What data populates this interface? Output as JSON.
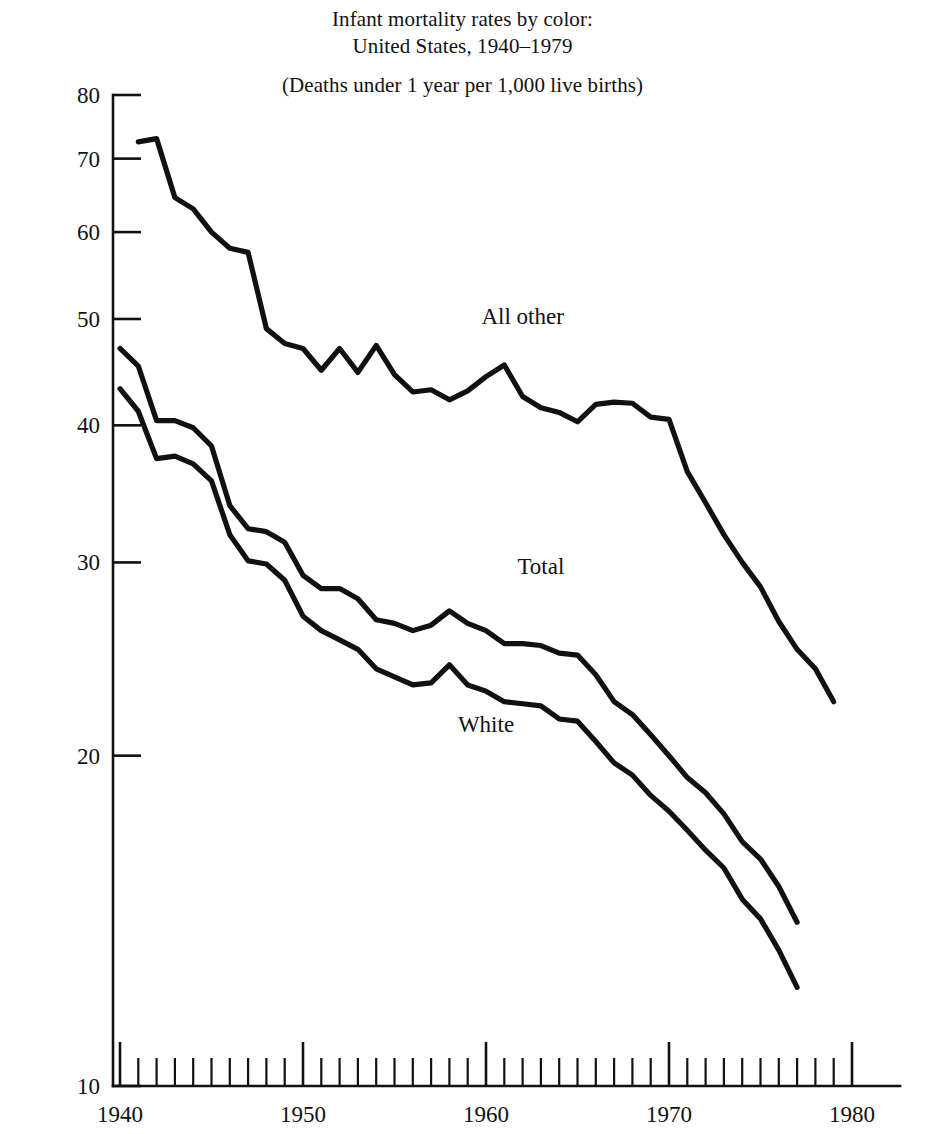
{
  "figure": {
    "title_line_1": "Infant mortality rates by color:",
    "title_line_2": "United States, 1940–1979",
    "subtitle": "(Deaths under 1 year per 1,000 live births)"
  },
  "chart_data": {
    "type": "line",
    "title": "Infant mortality rates by color: United States, 1940–1979",
    "subtitle": "(Deaths under 1 year per 1,000 live births)",
    "xlabel": "",
    "ylabel": "",
    "yscale": "log",
    "ylim": [
      10,
      80
    ],
    "xlim": [
      1940,
      1980
    ],
    "grid": false,
    "legend_position": "inline-labels",
    "ytick_labels": [
      "10",
      "20",
      "30",
      "40",
      "50",
      "60",
      "70",
      "80"
    ],
    "ytick_values": [
      10,
      20,
      30,
      40,
      50,
      60,
      70,
      80
    ],
    "xtick_labels": [
      "1940",
      "1950",
      "1960",
      "1970",
      "1980"
    ],
    "xtick_values": [
      1940,
      1950,
      1960,
      1970,
      1980
    ],
    "xtick_minor_step": 1,
    "x": [
      1940,
      1941,
      1942,
      1943,
      1944,
      1945,
      1946,
      1947,
      1948,
      1949,
      1950,
      1951,
      1952,
      1953,
      1954,
      1955,
      1956,
      1957,
      1958,
      1959,
      1960,
      1961,
      1962,
      1963,
      1964,
      1965,
      1966,
      1967,
      1968,
      1969,
      1970,
      1971,
      1972,
      1973,
      1974,
      1975,
      1976,
      1977,
      1978,
      1979
    ],
    "series": [
      {
        "name": "All other",
        "label": "All other",
        "color": "#111111",
        "x_start": 1941,
        "x_end": 1979,
        "values": [
          null,
          72.5,
          73.0,
          64.5,
          63.0,
          60.0,
          58.0,
          57.5,
          49.0,
          47.5,
          47.0,
          44.9,
          47.0,
          44.7,
          47.3,
          44.5,
          42.9,
          43.1,
          42.2,
          43.0,
          44.3,
          45.4,
          42.5,
          41.5,
          41.1,
          40.3,
          41.8,
          42.0,
          41.9,
          40.7,
          40.5,
          36.3,
          34.0,
          31.8,
          30.0,
          28.5,
          26.5,
          25.0,
          24.0,
          22.4
        ]
      },
      {
        "name": "Total",
        "label": "Total",
        "color": "#111111",
        "x_start": 1940,
        "x_end": 1977,
        "values": [
          47.0,
          45.3,
          40.4,
          40.4,
          39.8,
          38.3,
          33.8,
          32.2,
          32.0,
          31.3,
          29.2,
          28.4,
          28.4,
          27.8,
          26.6,
          26.4,
          26.0,
          26.3,
          27.1,
          26.4,
          26.0,
          25.3,
          25.3,
          25.2,
          24.8,
          24.7,
          23.7,
          22.4,
          21.8,
          20.9,
          20.0,
          19.1,
          18.5,
          17.7,
          16.7,
          16.1,
          15.2,
          14.1,
          null,
          null
        ]
      },
      {
        "name": "White",
        "label": "White",
        "color": "#111111",
        "x_start": 1940,
        "x_end": 1977,
        "values": [
          43.2,
          41.2,
          37.3,
          37.5,
          36.9,
          35.6,
          31.8,
          30.1,
          29.9,
          28.9,
          26.8,
          26.0,
          25.5,
          25.0,
          24.0,
          23.6,
          23.2,
          23.3,
          24.2,
          23.2,
          22.9,
          22.4,
          22.3,
          22.2,
          21.6,
          21.5,
          20.6,
          19.7,
          19.2,
          18.4,
          17.8,
          17.1,
          16.4,
          15.8,
          14.8,
          14.2,
          13.3,
          12.3,
          null,
          null
        ]
      }
    ],
    "annotations": [
      {
        "text": "All other",
        "x": 1962,
        "y": 49.5
      },
      {
        "text": "Total",
        "x": 1963,
        "y": 29.3
      },
      {
        "text": "White",
        "x": 1960,
        "y": 21.0
      }
    ]
  }
}
